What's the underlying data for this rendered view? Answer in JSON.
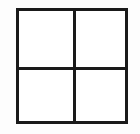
{
  "figure": {
    "name": "quartered-square",
    "caption": "",
    "background_color": "#fdfdfd",
    "cell_fill_color": "#ffffff",
    "stroke_color": "#1a1a1a",
    "stroke_width_px": 3,
    "canvas": {
      "width_px": 140,
      "height_px": 134
    },
    "square": {
      "left_px": 16,
      "top_px": 8,
      "width_px": 112,
      "height_px": 116
    },
    "dividers": [
      {
        "name": "vertical-divider",
        "orientation": "vertical",
        "position_px": 73
      },
      {
        "name": "horizontal-divider",
        "orientation": "horizontal",
        "position_px": 67
      }
    ],
    "cells": [
      {
        "name": "top-left-cell",
        "label": "",
        "row": 1,
        "column": 1,
        "fill": "#ffffff"
      },
      {
        "name": "top-right-cell",
        "label": "",
        "row": 1,
        "column": 2,
        "fill": "#ffffff"
      },
      {
        "name": "bottom-left-cell",
        "label": "",
        "row": 2,
        "column": 1,
        "fill": "#ffffff"
      },
      {
        "name": "bottom-right-cell",
        "label": "",
        "row": 2,
        "column": 2,
        "fill": "#ffffff"
      }
    ],
    "cell_count": 4
  }
}
